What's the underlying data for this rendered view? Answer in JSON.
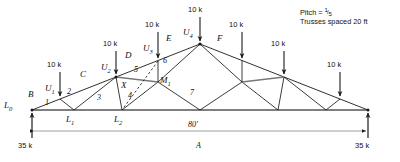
{
  "diagram": {
    "title_note": {
      "pitch_label": "Pitch =",
      "pitch_numerator": "1",
      "pitch_slash": "/",
      "pitch_denominator": "5",
      "spacing": "Trusses spaced 20 ft"
    },
    "span_dimension": "80'",
    "section_label": "A",
    "reactions": {
      "left": "35 k",
      "right": "35 k"
    },
    "loads": [
      {
        "id": "load-U1",
        "label": "10 k"
      },
      {
        "id": "load-U2",
        "label": "10 k"
      },
      {
        "id": "load-U3",
        "label": "10 k"
      },
      {
        "id": "load-U4",
        "label": "10 k"
      },
      {
        "id": "load-U5",
        "label": "10 k"
      },
      {
        "id": "load-U6",
        "label": "10 k"
      },
      {
        "id": "load-U7",
        "label": "10 k"
      }
    ],
    "joint_labels": [
      {
        "id": "L0",
        "base": "L",
        "sub": "0"
      },
      {
        "id": "L1",
        "base": "L",
        "sub": "1"
      },
      {
        "id": "L2",
        "base": "L",
        "sub": "2"
      },
      {
        "id": "U1",
        "base": "U",
        "sub": "1"
      },
      {
        "id": "U2",
        "base": "U",
        "sub": "2"
      },
      {
        "id": "U3",
        "base": "U",
        "sub": "3"
      },
      {
        "id": "U4",
        "base": "U",
        "sub": "4"
      },
      {
        "id": "M1",
        "base": "M",
        "sub": "1"
      }
    ],
    "member_letters": [
      "B",
      "C",
      "D",
      "E",
      "F"
    ],
    "point_label_X": "X",
    "panel_numbers": [
      "1",
      "2",
      "3",
      "4",
      "5",
      "6",
      "7"
    ]
  },
  "colors": {
    "line": "#1a1a1a",
    "text": "#111111",
    "background": "#ffffff"
  }
}
